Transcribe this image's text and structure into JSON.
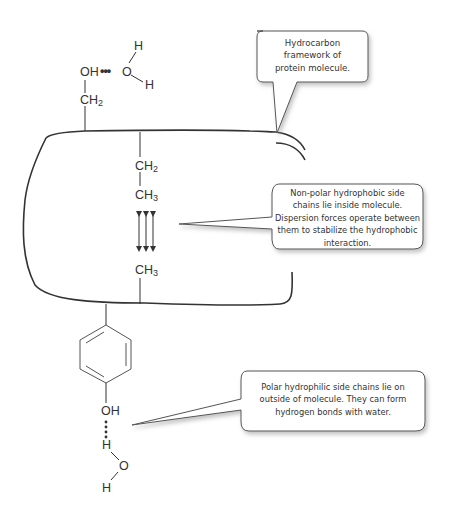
{
  "callouts": {
    "framework": {
      "lines": [
        "Hydrocarbon",
        "framework of",
        "protein molecule."
      ]
    },
    "nonpolar": {
      "lines": [
        "Non-polar hydrophobic side",
        "chains lie inside molecule.",
        "Dispersion forces operate between",
        "them to stabilize the hydrophobic",
        "interaction."
      ]
    },
    "polar": {
      "lines": [
        "Polar hydrophilic side chains lie on",
        "outside of molecule. They can form",
        "hydrogen bonds with water."
      ]
    }
  },
  "chemistry": {
    "top_oh": "OH",
    "top_hbond": "•••",
    "top_water_o": "O",
    "top_water_h1": "H",
    "top_water_h2": "H",
    "top_ch2": "CH",
    "top_ch2_sub": "2",
    "inner_ch2": "CH",
    "inner_ch2_sub": "2",
    "inner_ch3_a": "CH",
    "inner_ch3_a_sub": "3",
    "inner_ch3_b": "CH",
    "inner_ch3_b_sub": "3",
    "bottom_oh": "OH",
    "bottom_h": "H",
    "bottom_water_o": "O",
    "bottom_water_h": "H"
  },
  "colors": {
    "line": "#333333",
    "callout_border": "#555555",
    "callout_shadow": "#bbbbbb"
  }
}
